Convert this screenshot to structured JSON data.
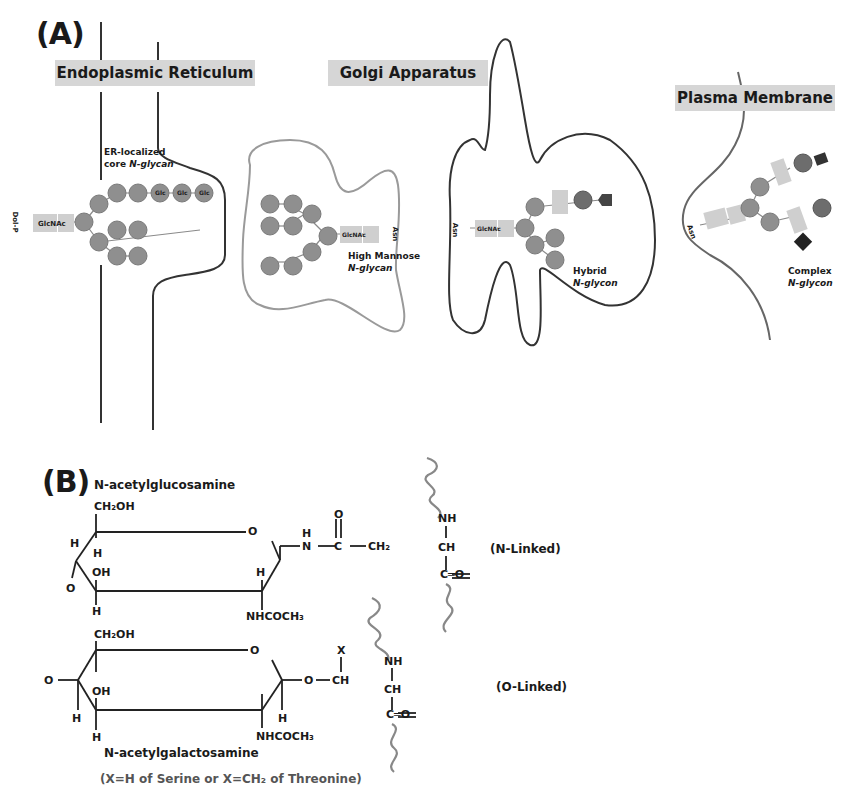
{
  "panel_a": {
    "label": "(A)",
    "compartments": {
      "er": "Endoplasmic Reticulum",
      "golgi": "Golgi Apparatus",
      "pm": "Plasma Membrane"
    },
    "glycans": {
      "er": {
        "line1": "ER-localized",
        "line2_prefix": "core ",
        "line2_italic": "N-glycan",
        "anchor": "Dol-P"
      },
      "high_mannose": {
        "line1": "High Mannose",
        "line2_italic": "N-glycan",
        "anchor": "Asn"
      },
      "hybrid": {
        "line1": "Hybrid",
        "line2_italic": "N-glycon",
        "anchor": "Asn"
      },
      "complex": {
        "line1": "Complex",
        "line2_italic": "N-glycon",
        "anchor": "Asn"
      }
    },
    "sugar_labels": {
      "glcnac": "GlcNAc",
      "man": "Man",
      "glc": "Glc",
      "gal": "Gal"
    }
  },
  "panel_b": {
    "label": "(B)",
    "glcnac": {
      "name": "N-acetylglucosamine",
      "ch2oh": "CH₂OH",
      "h1": "H",
      "h2": "H",
      "oh": "OH",
      "o_left": "O",
      "h3": "H",
      "ring_o": "O",
      "h4": "H",
      "nhcoch3": "NHCOCH₃",
      "link_h": "H",
      "link_n": "N",
      "link_c": "C",
      "link_o": "O",
      "link_ch2": "CH₂"
    },
    "n_peptide": {
      "nh": "NH",
      "ch": "CH",
      "co": "C═O",
      "linkage": "(N-Linked)"
    },
    "galnac": {
      "name": "N-acetylgalactosamine",
      "ch2oh": "CH₂OH",
      "o_left": "O",
      "oh": "OH",
      "h1": "H",
      "h2": "H",
      "ring_o": "O",
      "h3": "H",
      "nhcoch3": "NHCOCH₃",
      "link_o": "O",
      "x": "X",
      "ch": "CH"
    },
    "o_peptide": {
      "nh": "NH",
      "ch": "CH",
      "co": "C═O",
      "linkage": "(O-Linked)"
    },
    "footnote": "(X=H of Serine or X=CH₂ of Threonine)"
  }
}
